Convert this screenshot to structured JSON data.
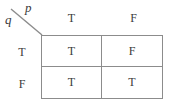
{
  "truth_table": {
    "corner": {
      "col_variable": "p",
      "row_variable": "q"
    },
    "col_headers": [
      "T",
      "F"
    ],
    "row_headers": [
      "T",
      "F"
    ],
    "cells": {
      "r0c0": "T",
      "r0c1": "F",
      "r1c0": "T",
      "r1c1": "T"
    },
    "colors": {
      "border": "#8c8c8c",
      "text": "#3b3b3b",
      "background": "#ffffff"
    }
  }
}
